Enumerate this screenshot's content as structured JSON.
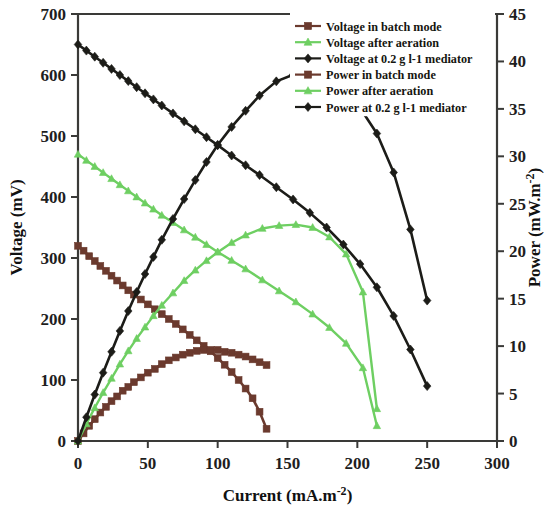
{
  "chart_data": {
    "type": "line",
    "title": "",
    "xlabel": "Current (mA.m-2)",
    "xlabel_base": "Current (mA.m",
    "xlabel_sup": "-2",
    "xlabel_tail": ")",
    "ylabel_left": "Voltage (mV)",
    "ylabel_right_base": "Power (mW.m",
    "ylabel_right_sup": "-2",
    "ylabel_right_tail": ")",
    "xlim": [
      0,
      300
    ],
    "ylim_left": [
      0,
      700
    ],
    "ylim_right": [
      0,
      45
    ],
    "xticks": [
      0,
      50,
      100,
      150,
      200,
      250,
      300
    ],
    "yticks_left": [
      0,
      100,
      200,
      300,
      400,
      500,
      600,
      700
    ],
    "yticks_right": [
      0,
      5,
      10,
      15,
      20,
      25,
      30,
      35,
      40,
      45
    ],
    "grid": false,
    "legend_position": "top-right",
    "colors": {
      "brown": "#6B3A2E",
      "green": "#6ECF62",
      "black": "#1C1C18"
    },
    "series": [
      {
        "name": "Voltage in batch mode",
        "color": "#6B3A2E",
        "axis": "left",
        "marker": "square",
        "x": [
          0,
          4,
          8,
          12,
          16,
          20,
          24,
          28,
          32,
          36,
          40,
          45,
          50,
          55,
          60,
          65,
          70,
          75,
          80,
          85,
          90,
          95,
          100,
          105,
          110,
          115,
          120,
          125,
          130,
          135
        ],
        "y": [
          320,
          312,
          303,
          295,
          287,
          279,
          271,
          263,
          255,
          247,
          240,
          232,
          224,
          216,
          208,
          200,
          192,
          183,
          174,
          165,
          156,
          147,
          136,
          125,
          113,
          100,
          86,
          70,
          48,
          20
        ]
      },
      {
        "name": "Voltage after aeration",
        "color": "#6ECF62",
        "axis": "left",
        "marker": "triangle",
        "x": [
          0,
          6,
          12,
          18,
          24,
          30,
          36,
          42,
          48,
          54,
          60,
          68,
          76,
          84,
          92,
          100,
          110,
          120,
          132,
          144,
          156,
          168,
          180,
          192,
          204,
          214
        ],
        "y": [
          470,
          460,
          450,
          440,
          430,
          420,
          410,
          400,
          390,
          380,
          370,
          358,
          346,
          334,
          322,
          310,
          296,
          282,
          264,
          246,
          228,
          208,
          186,
          160,
          120,
          25
        ]
      },
      {
        "name": "Voltage at 0.2 g l-1 mediator",
        "color": "#1C1C18",
        "axis": "left",
        "marker": "diamond",
        "x": [
          0,
          6,
          12,
          18,
          24,
          30,
          36,
          42,
          48,
          54,
          60,
          68,
          76,
          84,
          92,
          100,
          110,
          120,
          130,
          142,
          154,
          166,
          178,
          190,
          202,
          214,
          226,
          238,
          250
        ],
        "y": [
          650,
          640,
          630,
          620,
          610,
          600,
          590,
          580,
          570,
          560,
          550,
          537,
          524,
          511,
          498,
          485,
          468,
          452,
          436,
          416,
          396,
          374,
          350,
          322,
          290,
          252,
          205,
          150,
          90
        ]
      },
      {
        "name": "Power in batch mode",
        "color": "#6B3A2E",
        "axis": "right",
        "marker": "square",
        "x": [
          0,
          4,
          8,
          12,
          16,
          20,
          24,
          28,
          32,
          36,
          40,
          45,
          50,
          55,
          60,
          65,
          70,
          75,
          80,
          85,
          90,
          95,
          100,
          105,
          110,
          115,
          120,
          125,
          130,
          135
        ],
        "y": [
          0,
          0.8,
          1.6,
          2.3,
          3.0,
          3.6,
          4.2,
          4.7,
          5.3,
          5.7,
          6.2,
          6.7,
          7.2,
          7.6,
          8.1,
          8.5,
          8.8,
          9.1,
          9.3,
          9.5,
          9.6,
          9.6,
          9.6,
          9.4,
          9.3,
          9.1,
          8.9,
          8.6,
          8.3,
          8.0
        ]
      },
      {
        "name": "Power after aeration",
        "color": "#6ECF62",
        "axis": "right",
        "marker": "triangle",
        "x": [
          0,
          6,
          12,
          18,
          24,
          30,
          36,
          42,
          48,
          54,
          60,
          68,
          76,
          84,
          92,
          100,
          110,
          120,
          132,
          144,
          156,
          168,
          180,
          192,
          204,
          214
        ],
        "y": [
          0,
          1.8,
          3.5,
          5.1,
          6.6,
          8.1,
          9.5,
          10.8,
          12.0,
          13.2,
          14.3,
          15.6,
          16.9,
          18.0,
          19.0,
          19.9,
          20.9,
          21.7,
          22.4,
          22.7,
          22.8,
          22.5,
          21.5,
          19.7,
          15.7,
          3.4
        ]
      },
      {
        "name": "Power at 0.2 g l-1 mediator",
        "color": "#1C1C18",
        "axis": "right",
        "marker": "diamond",
        "x": [
          0,
          6,
          12,
          18,
          24,
          30,
          36,
          42,
          48,
          54,
          60,
          68,
          76,
          84,
          92,
          100,
          110,
          120,
          130,
          142,
          154,
          166,
          178,
          190,
          202,
          214,
          226,
          238,
          250
        ],
        "y": [
          0,
          2.5,
          4.9,
          7.2,
          9.4,
          11.6,
          13.7,
          15.7,
          17.6,
          19.4,
          21.2,
          23.4,
          25.5,
          27.5,
          29.4,
          31.2,
          33.1,
          34.8,
          36.4,
          37.9,
          38.6,
          38.6,
          38.1,
          36.9,
          35.1,
          32.4,
          28.3,
          22.3,
          14.8
        ]
      }
    ],
    "legend": [
      {
        "label": "Voltage in batch mode",
        "color": "#6B3A2E",
        "marker": "square"
      },
      {
        "label": "Voltage after aeration",
        "color": "#6ECF62",
        "marker": "triangle"
      },
      {
        "label": "Voltage at 0.2 g l-1 mediator",
        "color": "#1C1C18",
        "marker": "diamond"
      },
      {
        "label": "Power in batch mode",
        "color": "#6B3A2E",
        "marker": "square"
      },
      {
        "label": "Power after aeration",
        "color": "#6ECF62",
        "marker": "triangle"
      },
      {
        "label": "Power at 0.2 g l-1 mediator",
        "color": "#1C1C18",
        "marker": "diamond"
      }
    ]
  }
}
